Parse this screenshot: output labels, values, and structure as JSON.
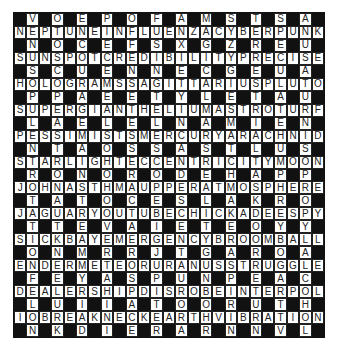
{
  "puzzle": {
    "rows": 25,
    "cols": 25,
    "colors": {
      "black": "#111111",
      "white": "#ffffff",
      "text": "#222222"
    },
    "grid": [
      ".V.O.E.P.O.F.A.M.S.T.S.A.",
      "NEPTUNEINFLUENZACYBERPUNK",
      ".N.O.C.E.F.S.X.G.Z.R.E.U.",
      "SUNSPOTCREDIBILITYPRECISE",
      ".S.C.U.E.N.N.E.C.G.E.U.A.",
      "HOLOGRAMSSAGITTARIUSPLUTO",
      ".P.P.A.E.E.T.Y.L.E.T.A.U.",
      "SUPERGIANTHELIUMASTROTURF",
      ".L.A.E.L.E.L.N.A.M.I.E.N.",
      "PESSIMISTSMERCURYARACHNID",
      ".N.T.A.O.S.S.A.S.T.L.U.S.",
      "STARLIGHTECCENTRICITYMOON",
      ".R.O.N.O.R.O.D.E.H.A.P.P.",
      "JOHNASTHMAUPPERATMOSPHERE",
      ".T.A.T.O.C.E.S.L.A.K.R.O.",
      "JAGUARYOUTUBECHICKADEESPY",
      ".T.T.E.V.A.I.E.T.E.O.Y.Y.",
      "SICKBAYEMERGENCYBROOMBALL",
      ".O.N.M.R.R.J.T.G.A.R.O.A.",
      "ENDERMETEORURANUSSTRUGGLE",
      ".F.E.Y.A.S.P.U.N.P.E.A.C.",
      "DEALERSHIPDISROBEINTERPOL",
      ".L.U.I.I.A.T.O.O.R.U.T.H.",
      "IOBREAKNECKEARTHVIBRATION",
      ".N.K.D.I.E.R.A.R.N.N.V.L."
    ],
    "across_words": [
      "NEPTUNE",
      "INFLUENZA",
      "CYBERPUNK",
      "SUNSPOT",
      "CREDIBILITY",
      "PRECISE",
      "HOLOGRAMS",
      "SAGITTARIUS",
      "PLUTO",
      "SUPERGIANT",
      "HELIUM",
      "ASTROTURF",
      "PESSIMISTS",
      "MERCURY",
      "ARACHNID",
      "STARLIGHT",
      "ECCENTRICITY",
      "MOON",
      "JOHN",
      "ASTHMA",
      "UPPER",
      "ATMOSPHERE",
      "JAGUAR",
      "YOUTUBE",
      "CHICKADEES",
      "SPY",
      "SICKBAY",
      "EMERGENCY",
      "BROOMBALL",
      "ENDER",
      "METEOR",
      "URANUS",
      "STRUGGLE",
      "DEALERSHIP",
      "DISROBE",
      "INTERPOL",
      "IO",
      "BREAKNECK",
      "EARTH",
      "VIBRATION"
    ]
  }
}
